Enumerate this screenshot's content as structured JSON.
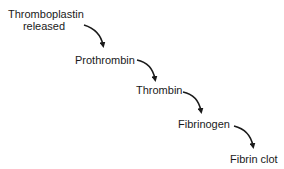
{
  "diagram": {
    "type": "cascade",
    "steps": [
      {
        "label_line1": "Thromboplastin",
        "label_line2": "released"
      },
      {
        "label": "Prothrombin"
      },
      {
        "label": "Thrombin"
      },
      {
        "label": "Fibrinogen"
      },
      {
        "label": "Fibrin clot"
      }
    ],
    "arrow_color": "#1a1a1a"
  }
}
